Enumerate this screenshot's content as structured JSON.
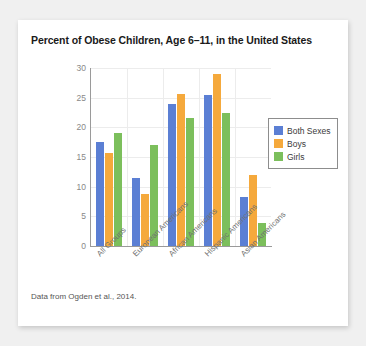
{
  "card": {
    "caption": "Data from Ogden et al., 2014."
  },
  "chart_data": {
    "type": "bar",
    "title": "Percent of Obese Children, Age 6–11, in the United States",
    "xlabel": "",
    "ylabel": "",
    "ylim": [
      0,
      30
    ],
    "yticks": [
      0,
      5,
      10,
      15,
      20,
      25,
      30
    ],
    "ytick_labels": [
      "0",
      "5",
      "10",
      "15",
      "20",
      "25",
      "30"
    ],
    "grid": true,
    "legend_position": "right",
    "categories": [
      "All Groups",
      "European Americans",
      "African Americans",
      "Hispanic Americans",
      "Asian Americans"
    ],
    "series": [
      {
        "name": "Both Sexes",
        "color": "#5B7FD4",
        "values": [
          17.5,
          11.5,
          24.0,
          25.4,
          8.2
        ]
      },
      {
        "name": "Boys",
        "color": "#F5A93C",
        "values": [
          15.6,
          8.7,
          25.7,
          29.0,
          12.0
        ]
      },
      {
        "name": "Girls",
        "color": "#7CBF5C",
        "values": [
          19.0,
          17.0,
          21.5,
          22.4,
          3.8
        ]
      }
    ]
  }
}
